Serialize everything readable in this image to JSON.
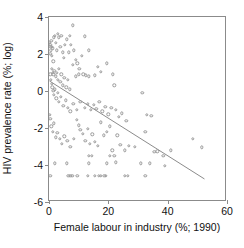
{
  "chart_data": {
    "type": "scatter",
    "title": "",
    "xlabel": "Female labour in industry (%; 1990)",
    "ylabel": "HIV prevalence rate (%; log)",
    "xlim": [
      0,
      60
    ],
    "ylim": [
      -6,
      4
    ],
    "xticks": [
      0,
      20,
      40,
      60
    ],
    "yticks": [
      4,
      2,
      0,
      -2,
      -4,
      -6
    ],
    "xtick_labels": [
      "0",
      "20",
      "40",
      "60"
    ],
    "ytick_labels": [
      "4",
      "2",
      "0",
      "-2",
      "-4",
      "-6"
    ],
    "grid": false,
    "legend": null,
    "marker": "open-circle",
    "marker_color": "#9a9a9a",
    "line_color": "#8a8a8a",
    "frame_color": "#8b8b8b",
    "trendline": {
      "type": "linear-fit",
      "x_start": 0.2,
      "y_start": 0.5,
      "x_end": 53.0,
      "y_end": -4.85
    },
    "points": [
      [
        0.3,
        2.6
      ],
      [
        0.4,
        2.4
      ],
      [
        0.5,
        2.5
      ],
      [
        0.6,
        2.2
      ],
      [
        0.8,
        2.7
      ],
      [
        0.5,
        2.0
      ],
      [
        0.9,
        1.9
      ],
      [
        1.0,
        2.4
      ],
      [
        1.2,
        2.3
      ],
      [
        1.4,
        1.6
      ],
      [
        1.6,
        2.9
      ],
      [
        2.0,
        3.0
      ],
      [
        2.2,
        2.6
      ],
      [
        2.6,
        2.2
      ],
      [
        3.0,
        3.1
      ],
      [
        3.4,
        2.9
      ],
      [
        3.8,
        2.4
      ],
      [
        4.2,
        3.0
      ],
      [
        4.6,
        2.1
      ],
      [
        5.0,
        1.8
      ],
      [
        5.4,
        2.5
      ],
      [
        6.0,
        2.8
      ],
      [
        6.6,
        2.1
      ],
      [
        7.0,
        3.0
      ],
      [
        7.4,
        2.5
      ],
      [
        8.0,
        3.55
      ],
      [
        8.4,
        2.2
      ],
      [
        9.0,
        1.7
      ],
      [
        9.6,
        1.5
      ],
      [
        10.2,
        1.2
      ],
      [
        11.0,
        1.9
      ],
      [
        12.0,
        2.95
      ],
      [
        13.5,
        2.2
      ],
      [
        16.5,
        1.3
      ],
      [
        19.5,
        1.5
      ],
      [
        1.0,
        1.2
      ],
      [
        1.3,
        1.0
      ],
      [
        1.5,
        0.9
      ],
      [
        1.8,
        1.1
      ],
      [
        2.2,
        0.8
      ],
      [
        2.6,
        1.0
      ],
      [
        3.0,
        0.6
      ],
      [
        3.4,
        1.2
      ],
      [
        3.8,
        0.5
      ],
      [
        4.2,
        0.9
      ],
      [
        4.6,
        0.3
      ],
      [
        5.2,
        0.7
      ],
      [
        5.8,
        0.2
      ],
      [
        6.4,
        0.6
      ],
      [
        7.0,
        0.1
      ],
      [
        8.0,
        1.4
      ],
      [
        9.0,
        0.8
      ],
      [
        10.0,
        0.9
      ],
      [
        11.5,
        0.9
      ],
      [
        12.5,
        0.85
      ],
      [
        13.5,
        0.8
      ],
      [
        15.5,
        0.85
      ],
      [
        17.5,
        1.05
      ],
      [
        21.5,
        0.9
      ],
      [
        22.0,
        0.3
      ],
      [
        0.4,
        0.9
      ],
      [
        0.6,
        0.6
      ],
      [
        0.9,
        0.4
      ],
      [
        1.1,
        0.2
      ],
      [
        1.4,
        0.0
      ],
      [
        1.7,
        -0.2
      ],
      [
        2.0,
        0.1
      ],
      [
        2.4,
        -0.4
      ],
      [
        2.9,
        -0.1
      ],
      [
        3.4,
        -0.6
      ],
      [
        4.0,
        -0.3
      ],
      [
        4.8,
        -0.8
      ],
      [
        5.6,
        -0.5
      ],
      [
        6.4,
        -0.9
      ],
      [
        7.2,
        -1.1
      ],
      [
        8.2,
        -0.7
      ],
      [
        9.4,
        -1.0
      ],
      [
        10.6,
        -0.6
      ],
      [
        12.0,
        -0.9
      ],
      [
        13.0,
        -0.7
      ],
      [
        14.0,
        -1.0
      ],
      [
        15.0,
        -0.75
      ],
      [
        16.0,
        -0.95
      ],
      [
        17.0,
        -0.6
      ],
      [
        18.0,
        -1.1
      ],
      [
        19.0,
        -0.85
      ],
      [
        20.0,
        -1.25
      ],
      [
        21.0,
        -0.9
      ],
      [
        22.5,
        -1.0
      ],
      [
        23.5,
        -1.4
      ],
      [
        24.5,
        -1.2
      ],
      [
        26.0,
        -1.6
      ],
      [
        31.5,
        -0.1
      ],
      [
        33.0,
        -1.3
      ],
      [
        34.5,
        -1.35
      ],
      [
        0.3,
        -1.3
      ],
      [
        0.5,
        -1.5
      ],
      [
        0.8,
        -1.9
      ],
      [
        1.2,
        -2.2
      ],
      [
        1.6,
        -1.75
      ],
      [
        2.2,
        -2.5
      ],
      [
        2.8,
        -2.25
      ],
      [
        3.6,
        -2.6
      ],
      [
        4.4,
        -2.85
      ],
      [
        5.2,
        -2.45
      ],
      [
        6.2,
        -2.7
      ],
      [
        7.2,
        -3.0
      ],
      [
        8.4,
        -2.6
      ],
      [
        9.4,
        -1.55
      ],
      [
        10.0,
        -1.85
      ],
      [
        10.6,
        -2.1
      ],
      [
        11.4,
        -2.3
      ],
      [
        12.2,
        -2.7
      ],
      [
        13.0,
        -2.05
      ],
      [
        13.8,
        -2.85
      ],
      [
        14.6,
        -2.35
      ],
      [
        15.4,
        -2.75
      ],
      [
        16.4,
        -2.95
      ],
      [
        17.4,
        -1.7
      ],
      [
        18.4,
        -2.4
      ],
      [
        19.4,
        -2.2
      ],
      [
        20.4,
        -1.9
      ],
      [
        21.4,
        -3.2
      ],
      [
        23.0,
        -2.4
      ],
      [
        24.0,
        -2.9
      ],
      [
        25.5,
        -3.2
      ],
      [
        27.0,
        -2.95
      ],
      [
        29.0,
        -3.0
      ],
      [
        32.5,
        -2.2
      ],
      [
        35.5,
        -3.3
      ],
      [
        36.5,
        -3.25
      ],
      [
        38.5,
        -3.5
      ],
      [
        41.0,
        -3.2
      ],
      [
        48.5,
        -2.6
      ],
      [
        51.5,
        -3.05
      ],
      [
        13.5,
        -3.5
      ],
      [
        14.5,
        -3.5
      ],
      [
        20.5,
        -3.5
      ],
      [
        22.0,
        -3.5
      ],
      [
        2.0,
        -3.9
      ],
      [
        6.0,
        -3.9
      ],
      [
        13.5,
        -3.9
      ],
      [
        19.5,
        -3.9
      ],
      [
        22.5,
        -3.85
      ],
      [
        31.0,
        -3.9
      ],
      [
        34.0,
        -3.9
      ],
      [
        39.0,
        -4.05
      ],
      [
        0.4,
        -4.6
      ],
      [
        6.5,
        -4.6
      ],
      [
        7.2,
        -4.6
      ],
      [
        7.8,
        -4.6
      ],
      [
        9.5,
        -4.6
      ],
      [
        13.0,
        -4.6
      ],
      [
        15.5,
        -4.6
      ],
      [
        16.8,
        -4.6
      ],
      [
        17.4,
        -4.6
      ],
      [
        18.6,
        -4.6
      ],
      [
        19.2,
        -4.6
      ],
      [
        25.5,
        -4.6
      ],
      [
        26.5,
        -4.6
      ],
      [
        32.5,
        -4.6
      ]
    ]
  }
}
